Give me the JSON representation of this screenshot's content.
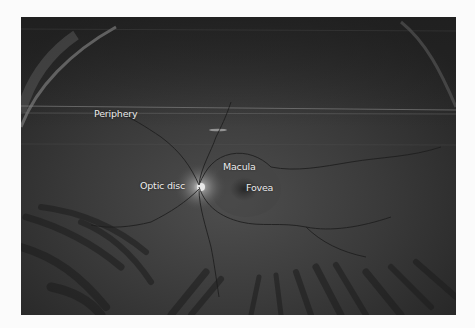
{
  "figure": {
    "labels": {
      "periphery": "Periphery",
      "macula": "Macula",
      "optic_disc": "Optic disc",
      "fovea": "Fovea"
    },
    "colors": {
      "page_background": "#fbfbfb",
      "retina_base": "#3a3a3a",
      "label_text": "#ececec"
    }
  }
}
